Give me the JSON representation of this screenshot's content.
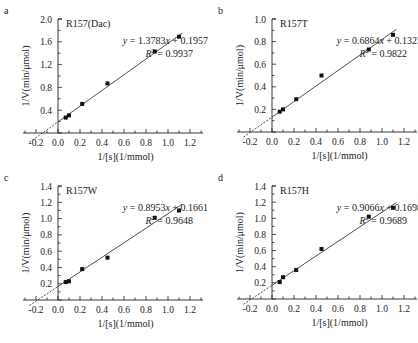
{
  "figure": {
    "panels": [
      "a",
      "b",
      "c",
      "d"
    ]
  },
  "chart_data": [
    {
      "type": "scatter",
      "panel": "a",
      "title": "R157(Dac)",
      "xlabel": "1/[s](1/mmol)",
      "ylabel": "1/V(min/μmol)",
      "xlim": [
        -0.3,
        1.3
      ],
      "ylim": [
        0,
        2.0
      ],
      "xticks": [
        -0.2,
        0.0,
        0.2,
        0.4,
        0.6,
        0.8,
        1.0,
        1.2
      ],
      "xtick_labels": [
        "-0.2",
        "0.0",
        "0.2",
        "0.4",
        "0.6",
        "0.8",
        "1.0",
        "1.2"
      ],
      "yticks": [
        0.4,
        0.8,
        1.2,
        1.6,
        2.0
      ],
      "ytick_labels": [
        "0.4",
        "0.8",
        "1.2",
        "1.6",
        "2.0"
      ],
      "x": [
        0.07,
        0.1,
        0.22,
        0.45,
        0.88,
        1.1
      ],
      "y": [
        0.27,
        0.31,
        0.51,
        0.87,
        1.43,
        1.69
      ],
      "fit": {
        "slope": 1.3783,
        "intercept": 0.1957,
        "r2": 0.9937
      },
      "equation": "y = 1.3783x + 0.1957",
      "r2_label": "R² = 0.9937",
      "grid": false,
      "px": {
        "x0": 58,
        "xscale": 110,
        "y0": 133,
        "yscale": 57,
        "ox": 0,
        "oy": 0
      }
    },
    {
      "type": "scatter",
      "panel": "b",
      "title": "R157T",
      "xlabel": "1/[s](1/mmol)",
      "ylabel": "1/V(min/μmol)",
      "xlim": [
        -0.3,
        1.3
      ],
      "ylim": [
        0,
        1.0
      ],
      "xticks": [
        -0.2,
        0.0,
        0.2,
        0.4,
        0.6,
        0.8,
        1.0,
        1.2
      ],
      "xtick_labels": [
        "-0.2",
        "0.0",
        "0.2",
        "0.4",
        "0.6",
        "0.8",
        "1.0",
        "1.2"
      ],
      "yticks": [
        0.2,
        0.4,
        0.6,
        0.8,
        1.0
      ],
      "ytick_labels": [
        "0.2",
        "0.4",
        "0.6",
        "0.8",
        "1.0"
      ],
      "x": [
        0.07,
        0.1,
        0.22,
        0.45,
        0.88,
        1.1
      ],
      "y": [
        0.18,
        0.2,
        0.29,
        0.5,
        0.73,
        0.86
      ],
      "fit": {
        "slope": 0.6864,
        "intercept": 0.1323,
        "r2": 0.9822
      },
      "equation": "y = 0.6864x + 0.1323",
      "r2_label": "R² = 0.9822",
      "grid": false,
      "px": {
        "x0": 272,
        "xscale": 110,
        "y0": 132,
        "yscale": 113,
        "ox": 0,
        "oy": 0
      }
    },
    {
      "type": "scatter",
      "panel": "c",
      "title": "R157W",
      "xlabel": "1/[s](1/mmol)",
      "ylabel": "1/V(min/μmol)",
      "xlim": [
        -0.3,
        1.3
      ],
      "ylim": [
        0,
        1.4
      ],
      "xticks": [
        -0.2,
        0.0,
        0.2,
        0.4,
        0.6,
        0.8,
        1.0,
        1.2
      ],
      "xtick_labels": [
        "-0.2",
        "0.0",
        "0.2",
        "0.4",
        "0.6",
        "0.8",
        "1.0",
        "1.2"
      ],
      "yticks": [
        0.2,
        0.4,
        0.6,
        0.8,
        1.0,
        1.2,
        1.4
      ],
      "ytick_labels": [
        "0.2",
        "0.4",
        "0.6",
        "0.8",
        "1.0",
        "1.2",
        "1.4"
      ],
      "x": [
        0.07,
        0.1,
        0.22,
        0.45,
        0.88,
        1.1
      ],
      "y": [
        0.22,
        0.23,
        0.38,
        0.52,
        1.01,
        1.1
      ],
      "fit": {
        "slope": 0.8953,
        "intercept": 0.1661,
        "r2": 0.9648
      },
      "equation": "y = 0.8953x + 0.1661",
      "r2_label": "R² = 0.9648",
      "grid": false,
      "px": {
        "x0": 58,
        "xscale": 110,
        "y0": 300,
        "yscale": 81.4,
        "ox": 0,
        "oy": 0
      }
    },
    {
      "type": "scatter",
      "panel": "d",
      "title": "R157H",
      "xlabel": "1/[s](1/mmol)",
      "ylabel": "1/V(min/μmol)",
      "xlim": [
        -0.3,
        1.3
      ],
      "ylim": [
        0,
        1.4
      ],
      "xticks": [
        -0.2,
        0.0,
        0.2,
        0.4,
        0.6,
        0.8,
        1.0,
        1.2
      ],
      "xtick_labels": [
        "-0.2",
        "0.0",
        "0.2",
        "0.4",
        "0.6",
        "0.8",
        "1.0",
        "1.2"
      ],
      "yticks": [
        0.2,
        0.4,
        0.6,
        0.8,
        1.0,
        1.2,
        1.4
      ],
      "ytick_labels": [
        "0.2",
        "0.4",
        "0.6",
        "0.8",
        "1.0",
        "1.2",
        "1.4"
      ],
      "x": [
        0.07,
        0.1,
        0.22,
        0.45,
        0.88,
        1.1
      ],
      "y": [
        0.21,
        0.27,
        0.36,
        0.62,
        1.02,
        1.13
      ],
      "fit": {
        "slope": 0.9066,
        "intercept": 0.1698,
        "r2": 0.9689
      },
      "equation": "y = 0.9066x + 0.1698",
      "r2_label": "R² = 0.9689",
      "grid": false,
      "px": {
        "x0": 272,
        "xscale": 110,
        "y0": 299,
        "yscale": 80.7,
        "ox": 0,
        "oy": 0
      }
    }
  ]
}
